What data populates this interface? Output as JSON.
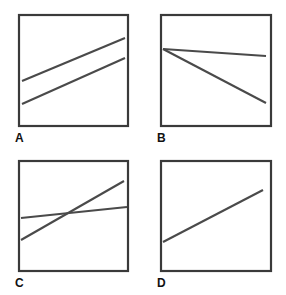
{
  "figure": {
    "title": "",
    "background_color": "#ffffff",
    "frame_color": "#3a3a3a",
    "line_color": "#4a4a4a",
    "label_color": "#111111",
    "panel_labels": [
      "A",
      "B",
      "C",
      "D"
    ]
  },
  "chart_data": {
    "type": "line",
    "title": "",
    "xlabel": "",
    "ylabel": "",
    "grid": false,
    "legend": null,
    "axis_ticks": [],
    "panels": [
      {
        "label": "A",
        "frame": {
          "x": 19,
          "y": 15,
          "width": 109,
          "height": 111
        },
        "xlim": [
          0,
          1
        ],
        "ylim": [
          0,
          1
        ],
        "series": [
          {
            "name": "upper-line",
            "x": [
              0.03,
              0.97
            ],
            "y": [
              0.41,
              0.79
            ],
            "slope": "positive",
            "points_px": [
              [
                22,
                81
              ],
              [
                125,
                38
              ]
            ]
          },
          {
            "name": "lower-line",
            "x": [
              0.03,
              0.97
            ],
            "y": [
              0.2,
              0.61
            ],
            "slope": "positive",
            "points_px": [
              [
                22,
                104
              ],
              [
                125,
                58
              ]
            ]
          }
        ]
      },
      {
        "label": "B",
        "frame": {
          "x": 161,
          "y": 15,
          "width": 110,
          "height": 111
        },
        "xlim": [
          0,
          1
        ],
        "ylim": [
          0,
          1
        ],
        "series": [
          {
            "name": "flat-line",
            "x": [
              0.01,
              0.95
            ],
            "y": [
              0.7,
              0.64
            ],
            "slope": "slightly-negative",
            "points_px": [
              [
                163,
                49
              ],
              [
                266,
                56
              ]
            ]
          },
          {
            "name": "steep-line",
            "x": [
              0.01,
              0.95
            ],
            "y": [
              0.7,
              0.22
            ],
            "slope": "negative",
            "points_px": [
              [
                163,
                49
              ],
              [
                266,
                103
              ]
            ]
          }
        ]
      },
      {
        "label": "C",
        "frame": {
          "x": 19,
          "y": 161,
          "width": 109,
          "height": 110
        },
        "xlim": [
          0,
          1
        ],
        "ylim": [
          0,
          1
        ],
        "series": [
          {
            "name": "flat-line",
            "x": [
              0.02,
              0.98
            ],
            "y": [
              0.48,
              0.58
            ],
            "slope": "slightly-positive",
            "points_px": [
              [
                21,
                218
              ],
              [
                127,
                207
              ]
            ]
          },
          {
            "name": "steep-line",
            "x": [
              0.02,
              0.95
            ],
            "y": [
              0.28,
              0.81
            ],
            "slope": "positive",
            "points_px": [
              [
                21,
                240
              ],
              [
                124,
                181
              ]
            ]
          }
        ],
        "intersection_px": [
          68,
          212
        ]
      },
      {
        "label": "D",
        "frame": {
          "x": 161,
          "y": 161,
          "width": 110,
          "height": 110
        },
        "xlim": [
          0,
          1
        ],
        "ylim": [
          0,
          1
        ],
        "series": [
          {
            "name": "single-line",
            "x": [
              0.01,
              0.93
            ],
            "y": [
              0.26,
              0.73
            ],
            "slope": "positive",
            "points_px": [
              [
                163,
                242
              ],
              [
                263,
                190
              ]
            ]
          }
        ]
      }
    ]
  }
}
